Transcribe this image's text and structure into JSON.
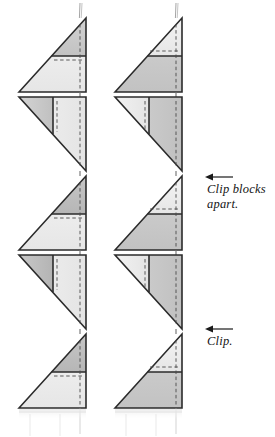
{
  "figure": {
    "background": "#ffffff",
    "width": 275,
    "height": 437
  },
  "annotations": [
    {
      "id": "clip-blocks-apart",
      "text": "Clip blocks\napart.",
      "arrow": "left-arrow-icon",
      "arrow_x1": 232,
      "arrow_x2": 207,
      "arrow_y": 177,
      "text_x": 207,
      "text_y": 182
    },
    {
      "id": "clip",
      "text": "Clip.",
      "arrow": "left-arrow-icon",
      "arrow_x1": 232,
      "arrow_x2": 207,
      "arrow_y": 329,
      "text_x": 207,
      "text_y": 334
    }
  ],
  "colors": {
    "outline": "#2b2b2b",
    "thread": "#9a9a9a",
    "dashed": "#4a4a4a",
    "light_gray": "#e9e9e9",
    "pale_gray": "#efefef",
    "medium_gray": "#c9c9c9",
    "dark_gray": "#bdbdbd",
    "shadow": "#d8d8d8",
    "paper": "#ffffff",
    "text": "#141414"
  },
  "columns": [
    {
      "id": "left-column",
      "x_left": 19,
      "x_right": 86,
      "blocks": [
        {
          "index": 0,
          "orientation": "up-right",
          "top_fill": "medium_gray",
          "bottom_fill": "pale_gray",
          "divider": "horizontal",
          "y_top": 18,
          "y_bottom": 92
        },
        {
          "index": 1,
          "orientation": "down-right",
          "left_fill": "medium_gray",
          "right_fill": "pale_gray",
          "divider": "vertical",
          "y_top": 97,
          "y_bottom": 171
        },
        {
          "index": 2,
          "orientation": "up-right",
          "top_fill": "dark_gray",
          "bottom_fill": "pale_gray",
          "divider": "horizontal",
          "y_top": 176,
          "y_bottom": 250
        },
        {
          "index": 3,
          "orientation": "down-right",
          "left_fill": "dark_gray",
          "right_fill": "pale_gray",
          "divider": "vertical",
          "y_top": 255,
          "y_bottom": 329
        },
        {
          "index": 4,
          "orientation": "up-right",
          "top_fill": "dark_gray",
          "bottom_fill": "pale_gray",
          "divider": "horizontal",
          "y_top": 334,
          "y_bottom": 408
        }
      ]
    },
    {
      "id": "right-column",
      "x_left": 115,
      "x_right": 182,
      "blocks": [
        {
          "index": 0,
          "orientation": "up-right",
          "top_fill": "pale_gray",
          "bottom_fill": "medium_gray",
          "divider": "horizontal",
          "y_top": 18,
          "y_bottom": 92
        },
        {
          "index": 1,
          "orientation": "down-right",
          "left_fill": "pale_gray",
          "right_fill": "medium_gray",
          "divider": "vertical",
          "y_top": 97,
          "y_bottom": 171
        },
        {
          "index": 2,
          "orientation": "up-right",
          "top_fill": "pale_gray",
          "bottom_fill": "medium_gray",
          "divider": "horizontal",
          "y_top": 176,
          "y_bottom": 250
        },
        {
          "index": 3,
          "orientation": "down-right",
          "left_fill": "pale_gray",
          "right_fill": "medium_gray",
          "divider": "vertical",
          "y_top": 255,
          "y_bottom": 329
        },
        {
          "index": 4,
          "orientation": "up-right",
          "top_fill": "pale_gray",
          "bottom_fill": "medium_gray",
          "divider": "horizontal",
          "y_top": 334,
          "y_bottom": 408
        }
      ]
    }
  ],
  "threads": [
    {
      "id": "left-thread-top",
      "x": 80,
      "y1": 5,
      "y2": 18
    },
    {
      "id": "right-thread-top",
      "x": 176,
      "y": 5,
      "y2": 18
    },
    {
      "id": "left-thread-bottom",
      "x": 80,
      "y1": 408,
      "y2": 432
    },
    {
      "id": "right-thread-bottom",
      "x": 176,
      "y1": 408,
      "y2": 432
    }
  ]
}
